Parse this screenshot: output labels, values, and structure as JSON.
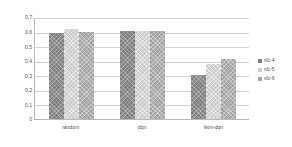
{
  "chart_data": {
    "type": "bar",
    "title": "",
    "subtitle": "",
    "xlabel": "",
    "ylabel": "",
    "categories": [
      "random",
      "dqn",
      "lstm-dqn"
    ],
    "series": [
      {
        "name": "sfc-4",
        "color": "#7f7f7f",
        "values": [
          0.59,
          0.605,
          0.3
        ]
      },
      {
        "name": "sfc-5",
        "color": "#cccccc",
        "values": [
          0.615,
          0.605,
          0.375
        ]
      },
      {
        "name": "sfc-6",
        "color": "#a3a3a3",
        "values": [
          0.6,
          0.607,
          0.415
        ]
      }
    ],
    "ylim": [
      0,
      0.7
    ],
    "ytick_labels": [
      "0.7",
      "0.6",
      "0.5",
      "0.4",
      "0.3",
      "0.2",
      "0.1",
      "0"
    ],
    "ytick_values": [
      0.7,
      0.6,
      0.5,
      0.4,
      0.3,
      0.2,
      0.1,
      0
    ],
    "grid": true,
    "legend_position": "right"
  }
}
